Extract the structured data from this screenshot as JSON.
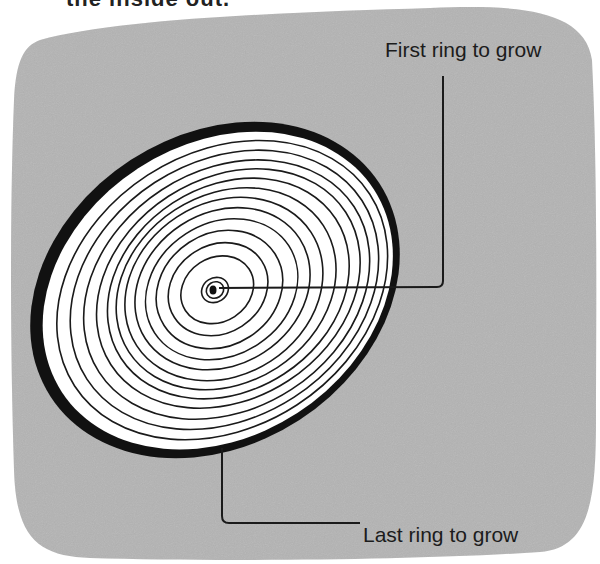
{
  "heading": {
    "text": "the inside out."
  },
  "diagram": {
    "labels": {
      "first_ring": "First ring to grow",
      "last_ring": "Last ring to grow"
    },
    "colors": {
      "background_panel": "#b4b4b4",
      "wood": "#ffffff",
      "bark": "#111111",
      "rings": "#1a1a1a",
      "text": "#1c1c1c"
    },
    "ring_count": 14
  }
}
